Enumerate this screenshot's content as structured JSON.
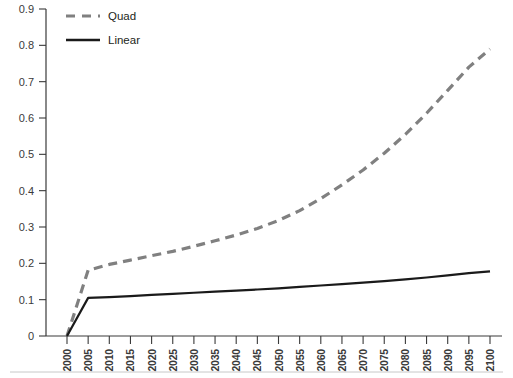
{
  "chart_data": {
    "type": "line",
    "title": "",
    "subtitle": "",
    "xlabel": "",
    "ylabel": "",
    "xlim": [
      2000,
      2100
    ],
    "ylim": [
      0,
      0.9
    ],
    "grid": false,
    "legend_position": "top-left",
    "x_tick_labels": [
      "2000",
      "2005",
      "2010",
      "2015",
      "2020",
      "2025",
      "2030",
      "2035",
      "2040",
      "2045",
      "2050",
      "2055",
      "2060",
      "2065",
      "2070",
      "2075",
      "2080",
      "2085",
      "2090",
      "2095",
      "2100"
    ],
    "y_tick_labels": [
      "0",
      "0.1",
      "0.2",
      "0.3",
      "0.4",
      "0.5",
      "0.6",
      "0.7",
      "0.8",
      "0.9"
    ],
    "y_tick_values": [
      0,
      0.1,
      0.2,
      0.3,
      0.4,
      0.5,
      0.6,
      0.7,
      0.8,
      0.9
    ],
    "x": [
      2000,
      2005,
      2010,
      2015,
      2020,
      2025,
      2030,
      2035,
      2040,
      2045,
      2050,
      2055,
      2060,
      2065,
      2070,
      2075,
      2080,
      2085,
      2090,
      2095,
      2100
    ],
    "series": [
      {
        "name": "Quad",
        "color": "#808080",
        "style": "dashed",
        "width": 3.2,
        "values": [
          0.0,
          0.181,
          0.197,
          0.209,
          0.221,
          0.233,
          0.247,
          0.262,
          0.278,
          0.296,
          0.318,
          0.345,
          0.378,
          0.416,
          0.457,
          0.503,
          0.555,
          0.613,
          0.676,
          0.74,
          0.79
        ]
      },
      {
        "name": "Linear",
        "color": "#1a1a1a",
        "style": "solid",
        "width": 2.2,
        "values": [
          0.0,
          0.105,
          0.107,
          0.11,
          0.113,
          0.116,
          0.119,
          0.122,
          0.125,
          0.128,
          0.131,
          0.135,
          0.139,
          0.143,
          0.147,
          0.151,
          0.156,
          0.161,
          0.167,
          0.173,
          0.178
        ]
      }
    ],
    "legend": [
      {
        "label": "Quad",
        "color": "#808080",
        "style": "dashed"
      },
      {
        "label": "Linear",
        "color": "#1a1a1a",
        "style": "solid"
      }
    ],
    "annotations": []
  },
  "colors": {
    "background": "#ffffff",
    "axis": "#3a3a3a",
    "text": "#231f20",
    "quad": "#808080",
    "linear": "#1a1a1a"
  }
}
